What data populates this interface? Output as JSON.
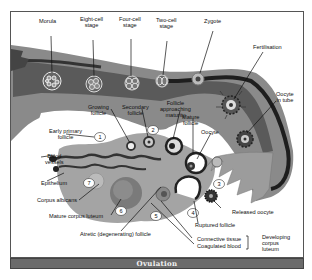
{
  "title": "Ovulation",
  "labels": {
    "morula": "Morula",
    "eight_cell": "Eight-cell\nstage",
    "four_cell": "Four-cell\nstage",
    "two_cell": "Two-cell\nstage",
    "zygote": "Zygote",
    "fertilisation": "Fertilisation",
    "oocyte_in_tube": "Oocyte\nin tube",
    "growing_follicle": "Growing\nfollicle",
    "secondary_follicle": "Secondary\nfollicle",
    "follicle_approaching": "Follicle\napproaching\nmaturity",
    "mature_follicle": "Mature\nfollicle",
    "oocyte": "Oocyte",
    "early_primary": "Early primary\nfollicle",
    "blood_vessels": "Blood\nvessels",
    "epithelium": "Epithelium",
    "corpus_albicans": "Corpus albicans",
    "mature_corpus_luteum": "Mature corpus luteum",
    "atretic_follicle": "Atretic (degenerating) follicle",
    "released_oocyte": "Released oocyte",
    "ruptured_follicle": "Ruptured follicle",
    "connective_tissue": "Connective tissue",
    "coagulated_blood": "Coagulated blood",
    "developing_corpus_luteum": "Developing\ncorpus\nluteum"
  },
  "stage_numbers": [
    "1",
    "2",
    "3",
    "4",
    "5",
    "6",
    "7"
  ],
  "colors": {
    "tube_dark": "#2a2a2a",
    "tube_mid": "#8a8a8a",
    "ovary": "#9a9a9a",
    "footer": "#6b6b6b"
  }
}
